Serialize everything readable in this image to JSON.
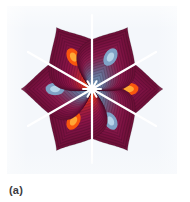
{
  "figure": {
    "caption": "(a)",
    "background_color": "#f4f7fb",
    "page_background": "#ffffff"
  },
  "chart_data": {
    "type": "heatmap",
    "subtype": "polar-contour-plot",
    "title": "",
    "subtitle": "",
    "xlabel": "",
    "ylabel": "",
    "grid": false,
    "legend": null,
    "axes_visible": false,
    "tick_labels": [],
    "annotations": [],
    "center": {
      "x": 0,
      "y": 0,
      "color": "#ffffff",
      "label": "node"
    },
    "petal_count": 6,
    "petal_angle_step_deg": 60,
    "petals": [
      {
        "index": 0,
        "angle_deg": 0,
        "core_sign": "positive",
        "core_color": "#ff5a0c",
        "edge_color": "#8e1448",
        "contour_rings": 18
      },
      {
        "index": 1,
        "angle_deg": 60,
        "core_sign": "negative",
        "core_color": "#7fa9cc",
        "edge_color": "#8e1448",
        "contour_rings": 18
      },
      {
        "index": 2,
        "angle_deg": 120,
        "core_sign": "positive",
        "core_color": "#ff5a0c",
        "edge_color": "#8e1448",
        "contour_rings": 18
      },
      {
        "index": 3,
        "angle_deg": 180,
        "core_sign": "negative",
        "core_color": "#7fa9cc",
        "edge_color": "#8e1448",
        "contour_rings": 18
      },
      {
        "index": 4,
        "angle_deg": 240,
        "core_sign": "positive",
        "core_color": "#ff5a0c",
        "edge_color": "#8e1448",
        "contour_rings": 18
      },
      {
        "index": 5,
        "angle_deg": 300,
        "core_sign": "negative",
        "core_color": "#7fa9cc",
        "edge_color": "#8e1448",
        "contour_rings": 18
      }
    ],
    "colormap_stops": [
      {
        "position": 0.0,
        "color": "#ffd27a"
      },
      {
        "position": 0.08,
        "color": "#ff8a1e"
      },
      {
        "position": 0.18,
        "color": "#f2480f"
      },
      {
        "position": 0.32,
        "color": "#cf2a2a"
      },
      {
        "position": 0.48,
        "color": "#a31d3f"
      },
      {
        "position": 0.64,
        "color": "#8e1448"
      },
      {
        "position": 0.8,
        "color": "#7c1242"
      },
      {
        "position": 1.0,
        "color": "#6e1038"
      }
    ],
    "cold_colormap_stops": [
      {
        "position": 0.0,
        "color": "#b9d7ea"
      },
      {
        "position": 0.1,
        "color": "#8fb6d4"
      },
      {
        "position": 0.22,
        "color": "#6f8fb3"
      },
      {
        "position": 0.38,
        "color": "#6a6a90"
      },
      {
        "position": 0.54,
        "color": "#7a3f68"
      },
      {
        "position": 0.7,
        "color": "#8a1c4d"
      },
      {
        "position": 0.85,
        "color": "#7c1242"
      },
      {
        "position": 1.0,
        "color": "#6e1038"
      }
    ],
    "separatrix_color": "#ffffff",
    "ylim": [
      -1,
      1
    ],
    "xlim": [
      -1,
      1
    ]
  }
}
